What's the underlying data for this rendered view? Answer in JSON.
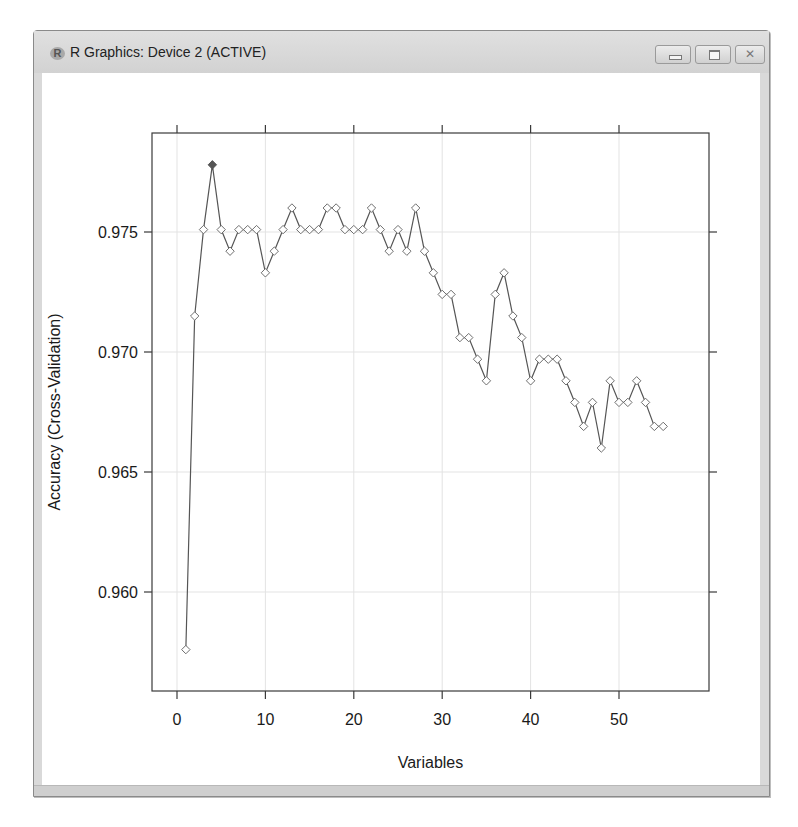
{
  "window": {
    "title": "R Graphics: Device 2 (ACTIVE)",
    "app_icon": "R",
    "controls": {
      "minimize": "minimize-icon",
      "maximize": "maximize-icon",
      "close": "close-icon"
    }
  },
  "chart_data": {
    "type": "line",
    "title": "",
    "xlabel": "Variables",
    "ylabel": "Accuracy (Cross-Validation)",
    "xlim": [
      -2,
      58
    ],
    "ylim": [
      0.9563,
      0.9795
    ],
    "x_ticks": [
      0,
      10,
      20,
      30,
      40,
      50
    ],
    "x_tick_labels": [
      "0",
      "10",
      "20",
      "30",
      "40",
      "50"
    ],
    "y_ticks": [
      0.96,
      0.965,
      0.97,
      0.975
    ],
    "y_tick_labels": [
      "0.960",
      "0.965",
      "0.970",
      "0.975"
    ],
    "grid": true,
    "legend": null,
    "marker": "open-diamond",
    "highlight": {
      "x": 4,
      "y": 0.9778,
      "marker": "filled-diamond"
    },
    "series": [
      {
        "name": "Accuracy",
        "x": [
          1,
          2,
          3,
          4,
          5,
          6,
          7,
          8,
          9,
          10,
          11,
          12,
          13,
          14,
          15,
          16,
          17,
          18,
          19,
          20,
          21,
          22,
          23,
          24,
          25,
          26,
          27,
          28,
          29,
          30,
          31,
          32,
          33,
          34,
          35,
          36,
          37,
          38,
          39,
          40,
          41,
          42,
          43,
          44,
          45,
          46,
          47,
          48,
          49,
          50,
          51,
          52,
          53,
          54,
          55
        ],
        "values": [
          0.9576,
          0.9715,
          0.9751,
          0.9778,
          0.9751,
          0.9742,
          0.9751,
          0.9751,
          0.9751,
          0.9733,
          0.9742,
          0.9751,
          0.976,
          0.9751,
          0.9751,
          0.9751,
          0.976,
          0.976,
          0.9751,
          0.9751,
          0.9751,
          0.976,
          0.9751,
          0.9742,
          0.9751,
          0.9742,
          0.976,
          0.9742,
          0.9733,
          0.9724,
          0.9724,
          0.9706,
          0.9706,
          0.9697,
          0.9688,
          0.9724,
          0.9733,
          0.9715,
          0.9706,
          0.9688,
          0.9697,
          0.9697,
          0.9697,
          0.9688,
          0.9679,
          0.9669,
          0.9679,
          0.966,
          0.9688,
          0.9679,
          0.9679,
          0.9688,
          0.9679,
          0.9669,
          0.9669
        ]
      }
    ]
  },
  "colors": {
    "line": "#555555",
    "marker_stroke": "#6e6e6e",
    "highlight_fill": "#555555",
    "grid": "#e3e3e3",
    "frame": "#3a3a3a"
  }
}
